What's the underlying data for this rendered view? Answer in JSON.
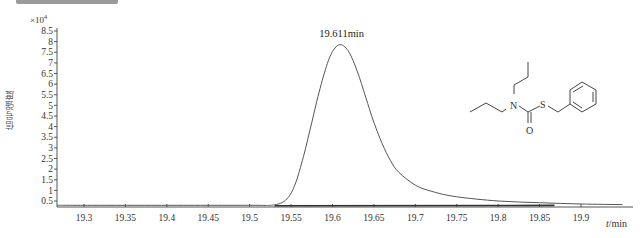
{
  "chart_data": {
    "type": "line",
    "title": "",
    "xlabel": "t/min",
    "xlabel_italic_part": "t",
    "xlabel_unit": "/min",
    "ylabel": "信号强度",
    "y_multiplier": "×10⁴",
    "y_multiplier_base": "×10",
    "y_multiplier_exp": "4",
    "xlim": [
      19.25,
      19.95
    ],
    "ylim": [
      0.3,
      8.6
    ],
    "grid": false,
    "legend": null,
    "xticks": [
      19.3,
      19.35,
      19.4,
      19.45,
      19.5,
      19.55,
      19.6,
      19.65,
      19.7,
      19.75,
      19.8,
      19.85,
      19.9
    ],
    "xtick_labels": [
      "19.3",
      "19.35",
      "19.4",
      "19.45",
      "19.5",
      "19.55",
      "19.6",
      "19.65",
      "19.7",
      "19.75",
      "19.8",
      "19.85",
      "19.9"
    ],
    "yticks": [
      0.5,
      1,
      1.5,
      2,
      2.5,
      3,
      3.5,
      4,
      4.5,
      5,
      5.5,
      6,
      6.5,
      7,
      7.5,
      8,
      8.5
    ],
    "ytick_labels": [
      "0.5",
      "1",
      "1.5",
      "2",
      "2.5",
      "3",
      "3.5",
      "4",
      "4.5",
      "5",
      "5.5",
      "6",
      "6.5",
      "7",
      "7.5",
      "8",
      "8.5"
    ],
    "annotations": [
      {
        "text": "19.611min",
        "x": 19.611,
        "y": 7.85
      }
    ],
    "series": [
      {
        "name": "chromatogram",
        "x": [
          19.26,
          19.3,
          19.4,
          19.5,
          19.53,
          19.545,
          19.555,
          19.565,
          19.575,
          19.585,
          19.595,
          19.603,
          19.611,
          19.62,
          19.63,
          19.64,
          19.65,
          19.66,
          19.67,
          19.68,
          19.7,
          19.72,
          19.75,
          19.8,
          19.85,
          19.9,
          19.95
        ],
        "y": [
          0.3,
          0.3,
          0.3,
          0.3,
          0.32,
          0.6,
          1.3,
          2.6,
          4.2,
          5.8,
          7.1,
          7.7,
          7.85,
          7.5,
          6.6,
          5.4,
          4.2,
          3.2,
          2.4,
          1.85,
          1.25,
          0.95,
          0.7,
          0.5,
          0.42,
          0.36,
          0.33
        ]
      }
    ]
  },
  "page": {
    "peak_label": "19.611min",
    "molecule_atoms": [
      "N",
      "S",
      "O"
    ]
  }
}
